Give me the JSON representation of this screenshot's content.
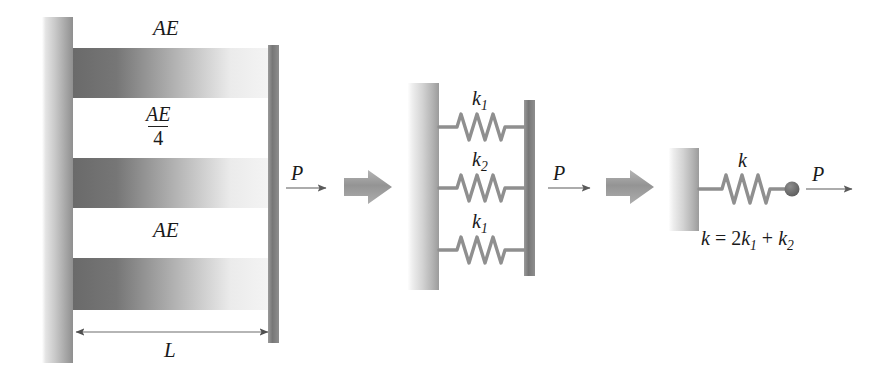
{
  "figure": {
    "background_color": "#ffffff",
    "ink_color": "#333333"
  },
  "panels": {
    "left": {
      "name": "three-parallel-bars",
      "bars": [
        {
          "label": "AE",
          "stiffness_relative": 1
        },
        {
          "label": "AE/4",
          "stiffness_relative": 0.25
        },
        {
          "label": "AE",
          "stiffness_relative": 1
        }
      ],
      "labels": {
        "bar_top": "AE",
        "bar_middle_numerator": "AE",
        "bar_middle_denominator": "4",
        "bar_bottom": "AE",
        "length": "L"
      },
      "force_label": "P"
    },
    "middle": {
      "name": "three-parallel-springs",
      "springs": [
        {
          "label_base": "k",
          "label_sub": "1"
        },
        {
          "label_base": "k",
          "label_sub": "2"
        },
        {
          "label_base": "k",
          "label_sub": "1"
        }
      ],
      "force_label": "P"
    },
    "right": {
      "name": "equivalent-single-spring",
      "spring_label": "k",
      "equation": "k = 2k",
      "equation_parts": {
        "lhs": "k",
        "equals": "=",
        "term1_coeff": "2",
        "term1_base": "k",
        "term1_sub": "1",
        "plus": "+",
        "term2_base": "k",
        "term2_sub": "2"
      },
      "force_label": "P"
    }
  },
  "colors": {
    "bar_gradient_dark": "#6f6f6f",
    "bar_gradient_light": "#f2f2f2",
    "wall_gradient_dark": "#9a9a9a",
    "wall_gradient_light": "#fafafa",
    "plate_dark": "#7b7b7b",
    "spring_stroke": "#8c8c8c",
    "block_arrow": "#9e9e9e",
    "thin_arrow": "#5a5a5a",
    "node_fill": "#6d6d6d"
  }
}
